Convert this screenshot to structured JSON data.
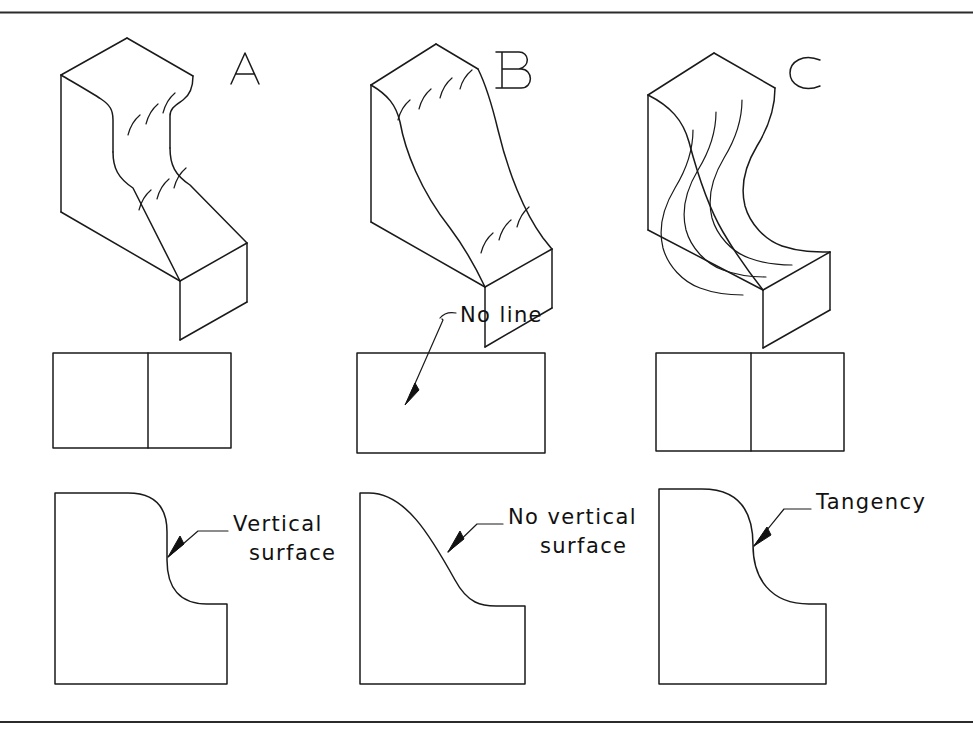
{
  "figure": {
    "kind": "engineering-drawing",
    "line_color": "#1a1a1a",
    "background_color": "#ffffff"
  },
  "border": {
    "top_rule": true,
    "bottom_rule": true,
    "rule_color": "#2b2b2b"
  },
  "columns": [
    {
      "id": "A",
      "label": "A",
      "iso": {
        "name": "isometric-a",
        "feature": "S-curve with straight vertical surface between the two fillets",
        "surface_tick_count": 6
      },
      "top_view": {
        "name": "top-view-a",
        "has_divider_line": true,
        "divider_note": "line shown where the vertical surface meets the curve"
      },
      "front_view": {
        "name": "front-view-a",
        "profile": "round-over, vertical flat, round-in"
      },
      "annotation": {
        "text_line1": "Vertical",
        "text_line2": "surface",
        "has_leader": true,
        "has_arrowhead": true
      }
    },
    {
      "id": "B",
      "label": "B",
      "iso": {
        "name": "isometric-b",
        "feature": "continuous sloping S-curve with no vertical surface",
        "surface_tick_count": 7
      },
      "top_view": {
        "name": "top-view-b",
        "has_divider_line": false,
        "divider_note": "no line appears in the top view"
      },
      "front_view": {
        "name": "front-view-b",
        "profile": "smooth S-curve, never vertical"
      },
      "annotation": {
        "text_line1": "No vertical",
        "text_line2": "surface",
        "has_leader": true,
        "has_arrowhead": true
      }
    },
    {
      "id": "C",
      "label": "C",
      "iso": {
        "name": "isometric-c",
        "feature": "two arcs meeting tangent at a single point",
        "surface_tick_count": 4
      },
      "top_view": {
        "name": "top-view-c",
        "has_divider_line": true,
        "divider_note": "line shown at the tangency point"
      },
      "front_view": {
        "name": "front-view-c",
        "profile": "convex arc tangent to concave arc"
      },
      "annotation": {
        "text_line1": "Tangency",
        "text_line2": "",
        "has_leader": true,
        "has_arrowhead": true
      }
    }
  ],
  "callouts": {
    "no_line": {
      "name": "callout-no-line",
      "text": "No  line",
      "points_to": "top-view-b"
    },
    "vertical_surface": {
      "name": "callout-vertical-surface",
      "line1": "Vertical",
      "line2": "surface",
      "points_to": "front-view-a"
    },
    "no_vertical_surface": {
      "name": "callout-no-vertical-surface",
      "line1": "No vertical",
      "line2": "surface",
      "points_to": "front-view-b"
    },
    "tangency": {
      "name": "callout-tangency",
      "line1": "Tangency",
      "line2": "",
      "points_to": "front-view-c"
    }
  }
}
